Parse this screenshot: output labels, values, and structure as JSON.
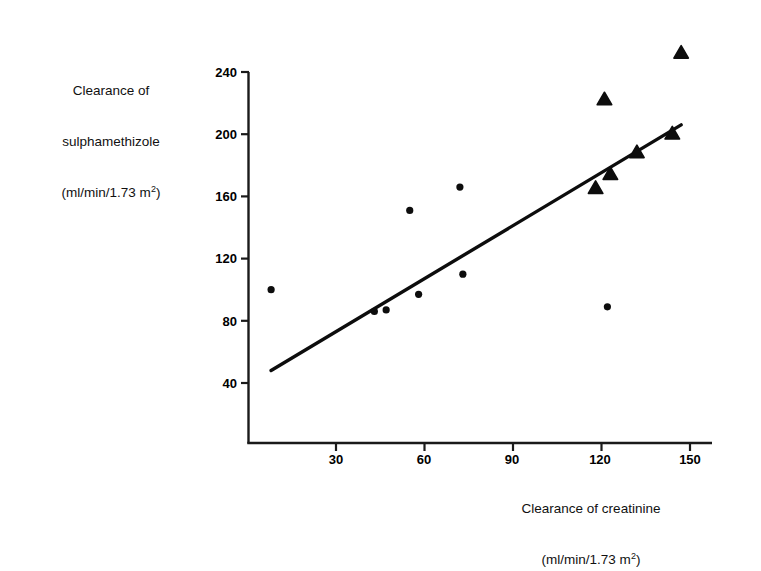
{
  "chart_data": {
    "type": "scatter",
    "title": "",
    "xlabel": "Clearance of creatinine (ml/min/1.73 m2)",
    "ylabel": "Clearance of sulphamethizole (ml/min/1.73 m2)",
    "xlim": [
      5,
      155
    ],
    "ylim": [
      0,
      262
    ],
    "grid": false,
    "legend": "none",
    "xticks": [
      30,
      60,
      90,
      120,
      150
    ],
    "yticks": [
      40,
      80,
      120,
      160,
      200,
      240
    ],
    "series": [
      {
        "name": "circle-points",
        "marker": "circle",
        "points": [
          [
            8,
            100
          ],
          [
            43,
            86
          ],
          [
            47,
            87
          ],
          [
            55,
            151
          ],
          [
            58,
            97
          ],
          [
            72,
            166
          ],
          [
            73,
            110
          ],
          [
            122,
            89
          ]
        ]
      },
      {
        "name": "triangle-points",
        "marker": "triangle",
        "points": [
          [
            118,
            165
          ],
          [
            121,
            222
          ],
          [
            123,
            174
          ],
          [
            132,
            188
          ],
          [
            144,
            200
          ],
          [
            147,
            252
          ]
        ]
      }
    ],
    "regression_line": {
      "name": "fitted-line",
      "x_start": 8,
      "y_start": 48,
      "x_end": 147,
      "y_end": 206
    }
  },
  "axis": {
    "y_title_line1": "Clearance of",
    "y_title_line2": "sulphamethizole",
    "y_title_line3_pre": "(ml/min/1.73 m",
    "y_title_line3_sup": "2",
    "y_title_line3_post": ")",
    "x_title_line1": "Clearance of creatinine",
    "x_title_line2_pre": "(ml/min/1.73 m",
    "x_title_line2_sup": "2",
    "x_title_line2_post": ")",
    "y_tick_labels": [
      "240",
      "200",
      "160",
      "120",
      "80",
      "40"
    ],
    "x_tick_labels": [
      "30",
      "60",
      "90",
      "120",
      "150"
    ]
  },
  "colors": {
    "ink": "#000000",
    "background": "#ffffff",
    "axis": "#1a1a1a"
  }
}
